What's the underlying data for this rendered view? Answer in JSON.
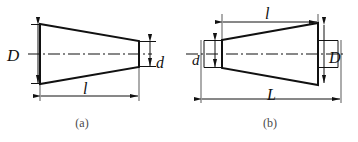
{
  "diagram": {
    "background_color": "#ffffff",
    "line_color": "#111111",
    "caption_color": "#4a4a4a",
    "centerline_style": "dash-dot"
  },
  "figures": [
    {
      "id": "a",
      "caption": "(a)",
      "shape": "tapered cone, wide end at left, narrow end at right",
      "dimensions": [
        {
          "symbol": "D",
          "meaning": "large end diameter",
          "position": "left-outside-vertical"
        },
        {
          "symbol": "d",
          "meaning": "small end diameter",
          "position": "right-outside-vertical"
        },
        {
          "symbol": "l",
          "meaning": "taper length",
          "position": "bottom-horizontal"
        }
      ]
    },
    {
      "id": "b",
      "caption": "(b)",
      "shape": "tapered cone, narrow end at left, wide end at right",
      "dimensions": [
        {
          "symbol": "l",
          "meaning": "taper length",
          "position": "top-horizontal"
        },
        {
          "symbol": "d",
          "meaning": "small end diameter",
          "position": "left-outside-vertical"
        },
        {
          "symbol": "D",
          "meaning": "large end diameter",
          "position": "right-inside-vertical"
        },
        {
          "symbol": "L",
          "meaning": "overall length",
          "position": "bottom-horizontal"
        }
      ]
    }
  ],
  "labels": {
    "fig_a": {
      "D": "D",
      "d": "d",
      "l": "l",
      "caption": "(a)"
    },
    "fig_b": {
      "l": "l",
      "d": "d",
      "D": "D",
      "L": "L",
      "caption": "(b)"
    }
  }
}
